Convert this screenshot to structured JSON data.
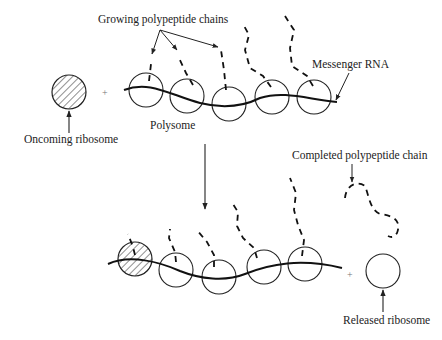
{
  "diagram": {
    "labels": {
      "growing_chains": "Growing polypeptide chains",
      "messenger_rna": "Messenger RNA",
      "polysome": "Polysome",
      "oncoming_ribosome": "Oncoming ribosome",
      "completed_chain": "Completed polypeptide chain",
      "released_ribosome": "Released ribosome",
      "plus_top": "+",
      "plus_bottom": "+"
    },
    "colors": {
      "stroke": "#222222",
      "background": "#ffffff"
    }
  }
}
